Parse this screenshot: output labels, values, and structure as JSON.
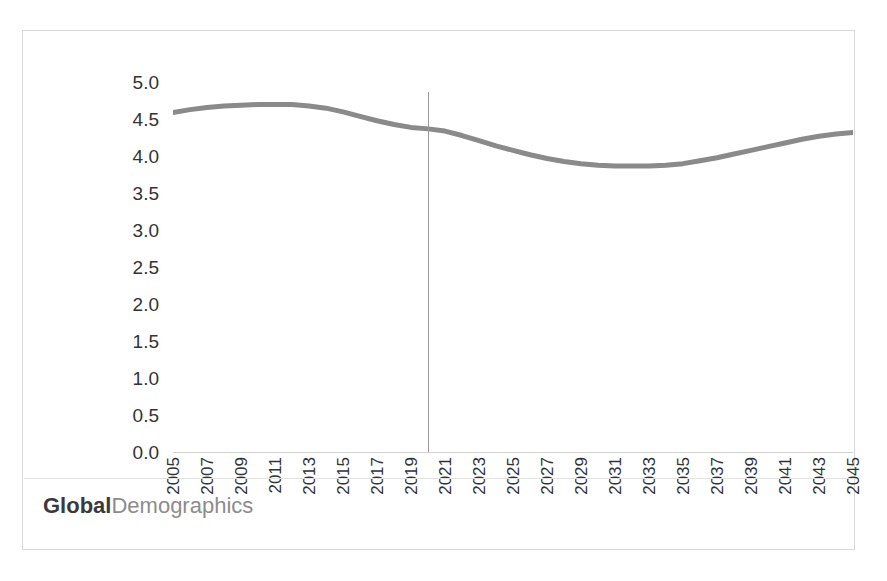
{
  "chart_data": {
    "type": "line",
    "title": "",
    "xlabel": "",
    "ylabel": "Births Mns per annum",
    "xlim": [
      2005,
      2045
    ],
    "ylim": [
      0.0,
      5.0
    ],
    "grid": false,
    "legend": "none",
    "line_color": "#8a8a8a",
    "divider_color": "#9a9a9a",
    "axis_color": "#d0d0d0",
    "x_tick_labels": [
      "2005",
      "2007",
      "2009",
      "2011",
      "2013",
      "2015",
      "2017",
      "2019",
      "2021",
      "2023",
      "2025",
      "2027",
      "2029",
      "2031",
      "2033",
      "2035",
      "2037",
      "2039",
      "2041",
      "2043",
      "2045"
    ],
    "y_tick_labels": [
      "5.0",
      "4.5",
      "4.0",
      "3.5",
      "3.0",
      "2.5",
      "2.0",
      "1.5",
      "1.0",
      "0.5",
      "0.0"
    ],
    "y_tick_values": [
      5.0,
      4.5,
      4.0,
      3.5,
      3.0,
      2.5,
      2.0,
      1.5,
      1.0,
      0.5,
      0.0
    ],
    "annotations": [
      {
        "name": "forecast-divider",
        "type": "vline",
        "x": 2020,
        "label": ""
      }
    ],
    "series": [
      {
        "name": "Births Mns per annum",
        "x": [
          2005,
          2006,
          2007,
          2008,
          2009,
          2010,
          2011,
          2012,
          2013,
          2014,
          2015,
          2016,
          2017,
          2018,
          2019,
          2020,
          2021,
          2022,
          2023,
          2024,
          2025,
          2026,
          2027,
          2028,
          2029,
          2030,
          2031,
          2032,
          2033,
          2034,
          2035,
          2036,
          2037,
          2038,
          2039,
          2040,
          2041,
          2042,
          2043,
          2044,
          2045
        ],
        "values": [
          4.6,
          4.64,
          4.67,
          4.69,
          4.7,
          4.71,
          4.71,
          4.71,
          4.69,
          4.66,
          4.61,
          4.55,
          4.49,
          4.44,
          4.4,
          4.38,
          4.35,
          4.29,
          4.22,
          4.15,
          4.09,
          4.03,
          3.98,
          3.94,
          3.91,
          3.89,
          3.88,
          3.88,
          3.88,
          3.89,
          3.91,
          3.95,
          3.99,
          4.04,
          4.09,
          4.14,
          4.19,
          4.24,
          4.28,
          4.31,
          4.33
        ]
      }
    ]
  },
  "footer": {
    "brand_primary": "Global",
    "brand_secondary": "Demographics"
  }
}
